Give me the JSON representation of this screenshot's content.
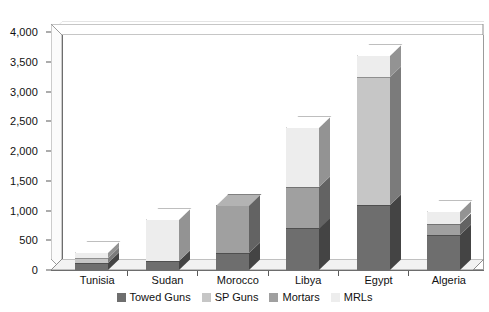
{
  "chart_data": {
    "type": "bar",
    "subtype": "stacked-column-3d",
    "title": "",
    "xlabel": "",
    "ylabel": "",
    "ylim": [
      0,
      4000
    ],
    "ytick_step": 500,
    "ytick_labels": [
      "0",
      "500",
      "1,000",
      "1,500",
      "2,000",
      "2,500",
      "3,000",
      "3,500",
      "4,000"
    ],
    "ytick_values": [
      0,
      500,
      1000,
      1500,
      2000,
      2500,
      3000,
      3500,
      4000
    ],
    "grid": true,
    "legend_position": "bottom",
    "categories": [
      "Tunisia",
      "Sudan",
      "Morocco",
      "Libya",
      "Egypt",
      "Algeria"
    ],
    "series": [
      {
        "name": "Towed Guns",
        "color": "#6e6e6e",
        "values": [
          115,
          150,
          290,
          700,
          1100,
          590
        ]
      },
      {
        "name": "SP Guns",
        "color": "#c6c6c6",
        "values": [
          85,
          0,
          0,
          0,
          2150,
          0
        ]
      },
      {
        "name": "Mortars",
        "color": "#a0a0a0",
        "values": [
          0,
          0,
          810,
          700,
          0,
          190
        ]
      },
      {
        "name": "MRLs",
        "color": "#ededed",
        "values": [
          95,
          700,
          0,
          1000,
          370,
          210
        ]
      }
    ],
    "totals": [
      295,
      850,
      1100,
      2400,
      3620,
      990
    ]
  },
  "legend": {
    "items": [
      {
        "label": "Towed Guns",
        "color": "#6e6e6e"
      },
      {
        "label": "SP Guns",
        "color": "#c6c6c6"
      },
      {
        "label": "Mortars",
        "color": "#a0a0a0"
      },
      {
        "label": "MRLs",
        "color": "#ededed"
      }
    ]
  }
}
